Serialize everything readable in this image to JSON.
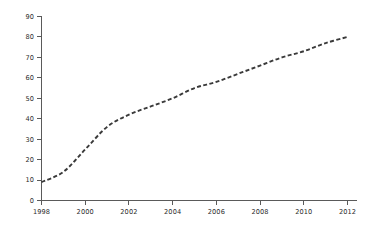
{
  "chart_data": {
    "type": "line",
    "title": "",
    "subtitle": "",
    "xlabel": "",
    "ylabel": "",
    "xlim": [
      1998,
      2012
    ],
    "ylim": [
      0,
      90
    ],
    "grid": false,
    "legend": null,
    "legend_position": "none",
    "line_style": "dashed",
    "line_color": "#3a3a3a",
    "axis_color": "#5a5a5a",
    "background_color": "#ffffff",
    "x_ticks": [
      1998,
      2000,
      2002,
      2004,
      2006,
      2008,
      2010,
      2012
    ],
    "x_tick_labels": [
      "1998",
      "2000",
      "2002",
      "2004",
      "2006",
      "2008",
      "2010",
      "2012"
    ],
    "y_ticks": [
      0,
      10,
      20,
      30,
      40,
      50,
      60,
      70,
      80,
      90
    ],
    "y_tick_labels": [
      "0",
      "10",
      "20",
      "30",
      "40",
      "50",
      "60",
      "70",
      "80",
      "90"
    ],
    "x": [
      1998,
      1999,
      2000,
      2001,
      2002,
      2003,
      2004,
      2005,
      2006,
      2007,
      2008,
      2009,
      2010,
      2011,
      2012
    ],
    "values": [
      9,
      14,
      25,
      36,
      42,
      46,
      50,
      55,
      58,
      62,
      66,
      70,
      73,
      77,
      80
    ],
    "series": [
      {
        "name": "series-1",
        "values": [
          9,
          14,
          25,
          36,
          42,
          46,
          50,
          55,
          58,
          62,
          66,
          70,
          73,
          77,
          80
        ]
      }
    ],
    "annotations": []
  }
}
